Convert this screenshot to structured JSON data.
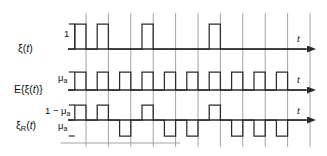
{
  "figure": {
    "background": "#ffffff",
    "stroke_color": "#2b2b2b",
    "grid_color": "#9a9a9a",
    "rows": [
      {
        "id": "xi",
        "signal_label_main": "ξ(",
        "signal_label_var": "t",
        "signal_label_end": ")",
        "amplitude_label": "1",
        "axis_label": "t",
        "baseline_y": 49,
        "high_y": 24,
        "pattern": [
          1,
          1,
          0,
          1,
          0,
          0,
          1,
          0,
          0,
          0
        ],
        "levels": [
          "0",
          "1"
        ]
      },
      {
        "id": "expected",
        "signal_label_main": "E{ξ(",
        "signal_label_var": "t",
        "signal_label_end": ")}",
        "amplitude_label": "μ",
        "amplitude_sub": "a",
        "axis_label": "t",
        "baseline_y": 90,
        "high_y": 72,
        "pattern": [
          1,
          1,
          1,
          1,
          1,
          1,
          1,
          1,
          1,
          1
        ],
        "levels": [
          "0",
          "μ_a"
        ]
      },
      {
        "id": "xi-R",
        "signal_label_main": "ξ",
        "signal_label_sub": "R",
        "signal_label_var": "t",
        "signal_label_end": ")",
        "amplitude_label_high": "1 − μ",
        "amplitude_label_high_sub": "a",
        "amplitude_label_low": "μ",
        "amplitude_label_low_sub": "a",
        "axis_label": "t",
        "baseline_y": 120,
        "high_y": 105,
        "low_y": 136,
        "pattern": [
          1,
          1,
          -1,
          1,
          -1,
          -1,
          1,
          -1,
          -1,
          -1
        ],
        "levels": [
          "-μ_a",
          "1-μ_a"
        ]
      }
    ],
    "grid": {
      "x_start": 86,
      "x_spacing": 22.4,
      "count": 11,
      "y_top": 13,
      "y_bottom": 147
    },
    "axis": {
      "x_start": 68,
      "x_end": 316,
      "arrow": "right-arrow"
    },
    "slot_width": 11.2,
    "slot_origin": 74.8
  },
  "chart_data": {
    "type": "line",
    "title": "",
    "xlabel": "t",
    "ylabel": "",
    "series": [
      {
        "name": "ξ(t)",
        "type": "binary-square-wave",
        "values": [
          1,
          1,
          0,
          1,
          0,
          0,
          1,
          0,
          0,
          0
        ],
        "high": "1",
        "low": "0"
      },
      {
        "name": "E{ξ(t)}",
        "type": "periodic-square-wave",
        "values": [
          1,
          1,
          1,
          1,
          1,
          1,
          1,
          1,
          1,
          1
        ],
        "high": "μ_a",
        "low": "0"
      },
      {
        "name": "ξ_R(t)",
        "type": "bipolar-square-wave",
        "values": [
          1,
          1,
          -1,
          1,
          -1,
          -1,
          1,
          -1,
          -1,
          -1
        ],
        "high": "1 − μ_a",
        "low": "μ_a"
      }
    ]
  }
}
